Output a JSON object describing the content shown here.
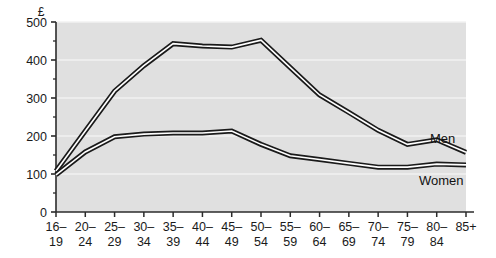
{
  "chart_data": {
    "type": "line",
    "title": "",
    "xlabel": "",
    "ylabel": "",
    "unit_label": "£",
    "grid": true,
    "legend_position": "inline-right",
    "ylim": [
      0,
      500
    ],
    "yticks": [
      0,
      100,
      200,
      300,
      400,
      500
    ],
    "ytick_labels": [
      "0",
      "100",
      "200",
      "300",
      "400",
      "500"
    ],
    "categories": [
      "16–19",
      "20–24",
      "25–29",
      "30–34",
      "35–39",
      "40–44",
      "45–49",
      "50–54",
      "55–59",
      "60–64",
      "65–69",
      "70–74",
      "75–79",
      "80–84",
      "85+"
    ],
    "category_lines": [
      [
        "16–",
        "19"
      ],
      [
        "20–",
        "24"
      ],
      [
        "25–",
        "29"
      ],
      [
        "30–",
        "34"
      ],
      [
        "35–",
        "39"
      ],
      [
        "40–",
        "44"
      ],
      [
        "45–",
        "49"
      ],
      [
        "50–",
        "54"
      ],
      [
        "55–",
        "59"
      ],
      [
        "60–",
        "64"
      ],
      [
        "65–",
        "69"
      ],
      [
        "70–",
        "74"
      ],
      [
        "75–",
        "79"
      ],
      [
        "80–",
        "84"
      ],
      [
        "85+",
        ""
      ]
    ],
    "series": [
      {
        "name": "Men",
        "label": "Men",
        "color": "#1a1a1a",
        "values": [
          108,
          213,
          318,
          385,
          443,
          437,
          434,
          452,
          380,
          308,
          262,
          215,
          178,
          190,
          157
        ]
      },
      {
        "name": "Women",
        "label": "Women",
        "color": "#1a1a1a",
        "values": [
          98,
          158,
          198,
          205,
          208,
          208,
          213,
          178,
          148,
          138,
          128,
          118,
          118,
          126,
          124
        ]
      }
    ]
  },
  "colors": {
    "plot_background": "#e0e0e0",
    "gridline": "#f2f2f2",
    "axis": "#2b2b2b",
    "text": "#1a1a1a",
    "line_outer": "#1a1a1a",
    "line_inner": "#ffffff",
    "page_background": "#ffffff"
  },
  "geometry": {
    "plot_left": 56,
    "plot_right": 466,
    "plot_top": 22,
    "plot_bottom": 212
  }
}
